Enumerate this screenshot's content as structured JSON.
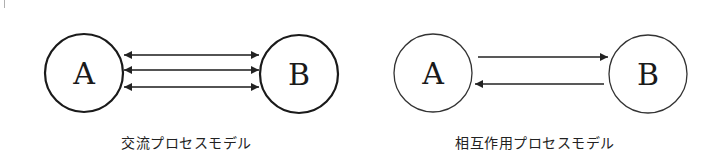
{
  "diagrams": [
    {
      "title": "交流プロセスモデル",
      "nodes": [
        {
          "id": "A",
          "label": "A"
        },
        {
          "id": "B",
          "label": "B"
        }
      ],
      "edges": [
        {
          "from": "A",
          "to": "B",
          "direction": "bidirectional"
        },
        {
          "from": "A",
          "to": "B",
          "direction": "bidirectional"
        },
        {
          "from": "A",
          "to": "B",
          "direction": "bidirectional"
        }
      ],
      "stroke_color": "#1a1a1a"
    },
    {
      "title": "相互作用プロセスモデル",
      "nodes": [
        {
          "id": "A",
          "label": "A"
        },
        {
          "id": "B",
          "label": "B"
        }
      ],
      "edges": [
        {
          "from": "A",
          "to": "B",
          "direction": "forward"
        },
        {
          "from": "B",
          "to": "A",
          "direction": "forward"
        }
      ],
      "stroke_color": "#333333"
    }
  ]
}
